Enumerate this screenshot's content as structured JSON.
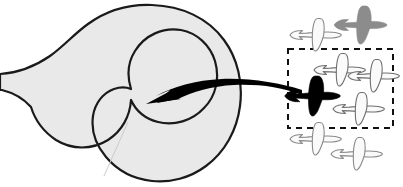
{
  "canvas": {
    "width": 403,
    "height": 187,
    "background": "#ffffff"
  },
  "diagram": {
    "title": "Target region with aircraft cluster and selection box"
  },
  "colors": {
    "region_fill": "#e9e9e9",
    "region_stroke": "#1a1a1a",
    "arrow_fill": "#000000",
    "selected_plane_fill": "#000000",
    "gray_plane_fill": "#8c8c8c",
    "white_plane_fill": "#fafafa",
    "white_plane_stroke": "#8a8a8a",
    "dashed_box_stroke": "#111111",
    "hairline": "#cccccc"
  },
  "region": {
    "label": "horseshoe-region",
    "fill": "#e9e9e9",
    "stroke": "#1a1a1a",
    "stroke_width": 2.2,
    "hairline_label": "internal-hairline"
  },
  "arrow": {
    "label": "curved-pointer-arrow",
    "direction": "right-to-left",
    "tip_x": 146,
    "tip_y": 104,
    "tail_x": 300,
    "tail_y": 92,
    "fill": "#000000"
  },
  "selection_box": {
    "label": "dashed-selection-box",
    "x": 288,
    "y": 49,
    "width": 105,
    "height": 79,
    "stroke": "#111111",
    "stroke_width": 2,
    "dash": "6 5"
  },
  "planes": [
    {
      "id": "plane-outside-top-left",
      "kind": "outline",
      "state": "unselected",
      "inside_box": false,
      "x": 316,
      "y": 35,
      "scale": 1.0,
      "rotation": 0,
      "fill": "#fafafa",
      "stroke": "#8a8a8a"
    },
    {
      "id": "plane-outside-top-right-gray",
      "kind": "filled",
      "state": "highlighted-gray",
      "inside_box": false,
      "x": 361,
      "y": 25,
      "scale": 1.0,
      "rotation": 0,
      "fill": "#8c8c8c",
      "stroke": "#8c8c8c"
    },
    {
      "id": "plane-selected-black",
      "kind": "filled",
      "state": "selected",
      "inside_box": true,
      "x": 313,
      "y": 96,
      "scale": 1.05,
      "rotation": 0,
      "fill": "#000000",
      "stroke": "#000000"
    },
    {
      "id": "plane-inside-upper-mid",
      "kind": "outline",
      "state": "unselected",
      "inside_box": true,
      "x": 340,
      "y": 70,
      "scale": 1.0,
      "rotation": 0,
      "fill": "#fafafa",
      "stroke": "#6f6f6f"
    },
    {
      "id": "plane-inside-upper-right",
      "kind": "outline",
      "state": "unselected",
      "inside_box": true,
      "x": 374,
      "y": 76,
      "scale": 1.0,
      "rotation": 0,
      "fill": "#fafafa",
      "stroke": "#6f6f6f"
    },
    {
      "id": "plane-inside-lower-right",
      "kind": "outline",
      "state": "unselected",
      "inside_box": true,
      "x": 359,
      "y": 109,
      "scale": 1.0,
      "rotation": 0,
      "fill": "#fafafa",
      "stroke": "#6f6f6f"
    },
    {
      "id": "plane-outside-bottom-left",
      "kind": "outline",
      "state": "unselected",
      "inside_box": false,
      "x": 316,
      "y": 139,
      "scale": 1.0,
      "rotation": 0,
      "fill": "#fafafa",
      "stroke": "#8a8a8a"
    },
    {
      "id": "plane-outside-bottom-right",
      "kind": "outline",
      "state": "unselected",
      "inside_box": false,
      "x": 357,
      "y": 154,
      "scale": 1.0,
      "rotation": 0,
      "fill": "#fafafa",
      "stroke": "#8a8a8a"
    }
  ]
}
